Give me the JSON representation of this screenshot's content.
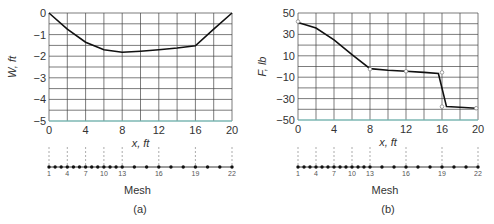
{
  "chart_data": [
    {
      "type": "line",
      "panel_label": "(a)",
      "title": "",
      "xlabel": "x, ft",
      "ylabel": "W, ft",
      "xlim": [
        0,
        20
      ],
      "ylim": [
        -5,
        0
      ],
      "x_ticks": [
        "0",
        "4",
        "8",
        "12",
        "16",
        "20"
      ],
      "y_ticks": [
        "0",
        "−1",
        "−2",
        "−3",
        "−4",
        "−5"
      ],
      "grid": true,
      "series": [
        {
          "name": "W",
          "x": [
            0,
            2,
            4,
            6,
            8,
            10,
            12,
            14,
            16,
            18,
            20
          ],
          "values": [
            0,
            -0.75,
            -1.35,
            -1.7,
            -1.82,
            -1.77,
            -1.7,
            -1.62,
            -1.52,
            -0.75,
            0
          ]
        }
      ],
      "mesh": {
        "label": "Mesh",
        "node_labels": [
          "1",
          "4",
          "7",
          "10",
          "13",
          "16",
          "19",
          "22"
        ],
        "node_count": 22,
        "node_x": [
          0,
          0.67,
          1.33,
          2,
          2.67,
          3.33,
          4,
          4.67,
          5.33,
          6,
          6.67,
          7.33,
          8,
          9.33,
          10.67,
          12,
          13.33,
          14.67,
          16,
          17.33,
          18.67,
          20
        ],
        "dashed_guides_x": [
          0,
          2,
          4,
          6,
          8,
          12,
          16,
          20
        ]
      }
    },
    {
      "type": "line",
      "panel_label": "(b)",
      "title": "",
      "xlabel": "x, ft",
      "ylabel": "F, lb",
      "xlim": [
        0,
        20
      ],
      "ylim": [
        -50,
        50
      ],
      "x_ticks": [
        "0",
        "4",
        "8",
        "12",
        "16",
        "20"
      ],
      "y_ticks": [
        "50",
        "30",
        "10",
        "−10",
        "−30",
        "−50"
      ],
      "grid": true,
      "series": [
        {
          "name": "F",
          "x": [
            0,
            2,
            4,
            6,
            8,
            10,
            12,
            14,
            15.6,
            16.5,
            18,
            19.8
          ],
          "values": [
            41,
            36,
            25,
            11,
            -2,
            -3.5,
            -4.5,
            -5.5,
            -6.5,
            -37.5,
            -38,
            -39
          ]
        }
      ],
      "markers": [
        {
          "x": 0,
          "y": 42
        },
        {
          "x": 8,
          "y": -2.5
        },
        {
          "x": 12,
          "y": -4.5
        },
        {
          "x": 16,
          "y": -5.5
        },
        {
          "x": 16,
          "y": -37.5
        },
        {
          "x": 19.8,
          "y": -39
        }
      ],
      "mesh": {
        "label": "Mesh",
        "node_labels": [
          "1",
          "4",
          "7",
          "10",
          "13",
          "16",
          "19",
          "22"
        ],
        "node_count": 22,
        "node_x": [
          0,
          0.67,
          1.33,
          2,
          2.67,
          3.33,
          4,
          4.67,
          5.33,
          6,
          6.67,
          7.33,
          8,
          9.33,
          10.67,
          12,
          13.33,
          14.67,
          16,
          17.33,
          18.67,
          20
        ],
        "dashed_guides_x": [
          0,
          2,
          4,
          6,
          8,
          12,
          16,
          20
        ]
      }
    }
  ],
  "panels": {
    "a": {
      "caption": "(a)",
      "xlabel": "x, ft",
      "ylabel": "W, ft",
      "mesh_label": "Mesh"
    },
    "b": {
      "caption": "(b)",
      "xlabel": "x, ft",
      "ylabel": "F, lb",
      "mesh_label": "Mesh"
    }
  },
  "colors": {
    "curve": "#111111",
    "grid": "#444444",
    "baseline_accent": "#7fd6d0",
    "marker": "#888888"
  }
}
